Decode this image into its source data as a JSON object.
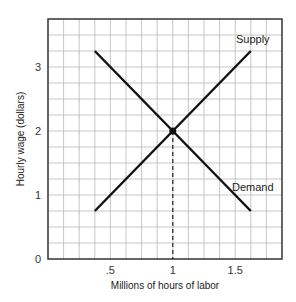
{
  "chart_data": {
    "type": "line",
    "title": "",
    "xlabel": "Millions of hours of labor",
    "ylabel": "Hourly wage (dollars)",
    "xlim": [
      0,
      1.875
    ],
    "ylim": [
      0,
      3.75
    ],
    "x_ticks": [
      {
        "value": 0.5,
        "label": ".5"
      },
      {
        "value": 1,
        "label": "1"
      },
      {
        "value": 1.5,
        "label": "1.5"
      }
    ],
    "y_ticks": [
      {
        "value": 0,
        "label": "0"
      },
      {
        "value": 1,
        "label": "1"
      },
      {
        "value": 2,
        "label": "2"
      },
      {
        "value": 3,
        "label": "3"
      }
    ],
    "grid": true,
    "grid_step_x": 0.125,
    "grid_step_y": 0.25,
    "series": [
      {
        "name": "Supply",
        "points": [
          [
            0.375,
            0.75
          ],
          [
            1.625,
            3.25
          ]
        ],
        "color": "#111111"
      },
      {
        "name": "Demand",
        "points": [
          [
            0.375,
            3.25
          ],
          [
            1.625,
            0.75
          ]
        ],
        "color": "#111111"
      }
    ],
    "annotations": [
      {
        "type": "point",
        "x": 1,
        "y": 2,
        "label": "equilibrium"
      },
      {
        "type": "dashed-vline",
        "x": 1,
        "from_y": 0,
        "to_y": 2
      }
    ],
    "legend": "inline labels at line ends"
  },
  "layout": {
    "plot": {
      "left": 48,
      "top": 19,
      "width": 234,
      "height": 240
    },
    "colors": {
      "grid": "#b8b8b8",
      "axis": "#333333",
      "line": "#111111",
      "text": "#333333"
    }
  }
}
